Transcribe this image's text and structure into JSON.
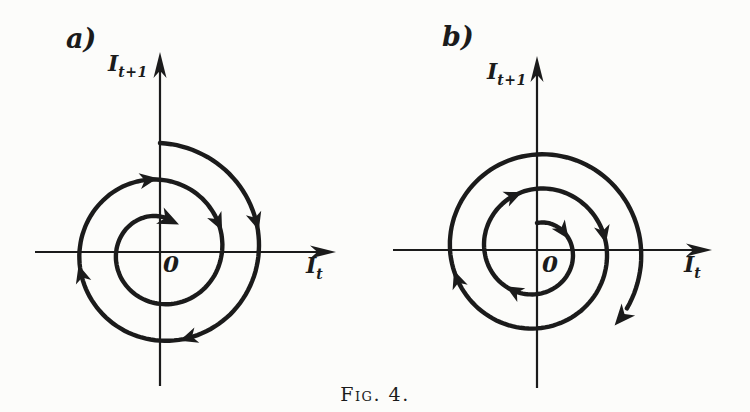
{
  "figure": {
    "caption": "Fig. 4.",
    "ink": "#1b1b1b",
    "paper": "#fcfcfa",
    "panels": [
      {
        "label": "a)",
        "axis_y": {
          "main": "I",
          "sub": "t+1"
        },
        "axis_x": {
          "main": "I",
          "sub": "t"
        },
        "origin": "0",
        "behavior": "damped oscillation: spiral converges clockwise toward 0",
        "geometry": {
          "cx": 160,
          "cy": 251,
          "x_axis": {
            "x1": 35,
            "x2": 336,
            "y": 252
          },
          "y_axis": {
            "x": 160,
            "y1": 52,
            "y2": 386
          },
          "spiral": {
            "direction": "clockwise",
            "theta_start": 90,
            "theta_end": -655,
            "r_start": 108,
            "r_end": 32,
            "arrows": [
              17,
              -72,
              -164,
              -261,
              -334
            ],
            "terminal_arrow": true
          }
        }
      },
      {
        "label": "b)",
        "axis_y": {
          "main": "I",
          "sub": "t+1"
        },
        "axis_x": {
          "main": "I",
          "sub": "t"
        },
        "origin": "0",
        "behavior": "explosive oscillation: spiral diverges clockwise away from 0",
        "geometry": {
          "cx": 537,
          "cy": 250,
          "x_axis": {
            "x1": 393,
            "x2": 712,
            "y": 250
          },
          "y_axis": {
            "x": 537,
            "y1": 56,
            "y2": 388
          },
          "spiral": {
            "direction": "clockwise",
            "theta_start": 90,
            "theta_end": -761,
            "r_start": 27,
            "r_end": 108,
            "arrows": [
              35,
              -120,
              -247,
              -347,
              -520
            ],
            "terminal_arrow": true
          }
        }
      }
    ]
  }
}
